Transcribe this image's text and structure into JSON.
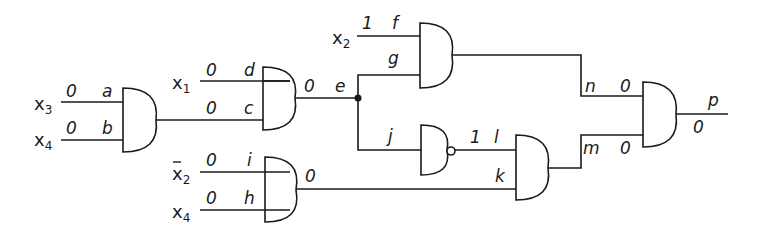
{
  "diagram": {
    "type": "logic-circuit",
    "inputs": [
      {
        "id": "x3a",
        "name": "x",
        "subscript": "3",
        "bar": false,
        "value": "0",
        "wire": "a"
      },
      {
        "id": "x4a",
        "name": "x",
        "subscript": "4",
        "bar": false,
        "value": "0",
        "wire": "b"
      },
      {
        "id": "x1",
        "name": "x",
        "subscript": "1",
        "bar": false,
        "value": "0",
        "wire": "d"
      },
      {
        "id": "x2",
        "name": "x",
        "subscript": "2",
        "bar": false,
        "value": "1",
        "wire": "f"
      },
      {
        "id": "x2bar",
        "name": "x",
        "subscript": "2",
        "bar": true,
        "value": "0",
        "wire": "i"
      },
      {
        "id": "x4b",
        "name": "x",
        "subscript": "4",
        "bar": false,
        "value": "0",
        "wire": "h"
      }
    ],
    "labels": {
      "a": "a",
      "b": "b",
      "c": "c",
      "d": "d",
      "e": "e",
      "f": "f",
      "g": "g",
      "h": "h",
      "i": "i",
      "j": "j",
      "k": "k",
      "l": "l",
      "m": "m",
      "n": "n",
      "p": "p"
    },
    "values": {
      "a": "0",
      "b": "0",
      "c": "0",
      "d": "0",
      "e": "0",
      "f": "1",
      "h": "0",
      "i": "0",
      "k": "0",
      "l": "1",
      "n": "0",
      "m": "0",
      "p": "0"
    },
    "gates": [
      {
        "id": "g1",
        "type": "AND",
        "inputs": [
          "a",
          "b"
        ],
        "output": "c"
      },
      {
        "id": "g2",
        "type": "AND",
        "inputs": [
          "d",
          "c"
        ],
        "output": "e"
      },
      {
        "id": "g3",
        "type": "AND",
        "inputs": [
          "f",
          "g"
        ],
        "output": "n"
      },
      {
        "id": "g4",
        "type": "NAND",
        "inputs": [
          "j"
        ],
        "output": "l"
      },
      {
        "id": "g5",
        "type": "AND",
        "inputs": [
          "i",
          "h"
        ],
        "output": "k"
      },
      {
        "id": "g6",
        "type": "AND",
        "inputs": [
          "l",
          "k"
        ],
        "output": "m"
      },
      {
        "id": "g7",
        "type": "AND",
        "inputs": [
          "n",
          "m"
        ],
        "output": "p"
      }
    ]
  }
}
